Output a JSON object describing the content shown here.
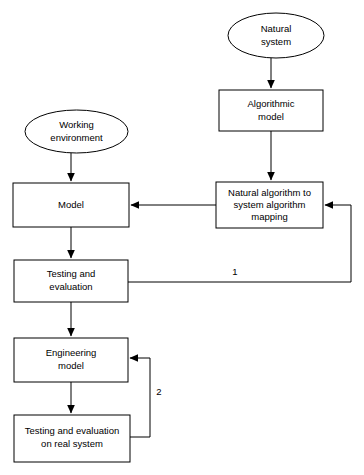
{
  "diagram": {
    "background_color": "#ffffff",
    "stroke_color": "#000000",
    "nodes": [
      {
        "id": "natural-system",
        "shape": "ellipse",
        "lines": [
          "Natural",
          "system"
        ],
        "cx": 276,
        "cy": 35.5,
        "rx": 48,
        "ry": 22.5
      },
      {
        "id": "algorithmic-model",
        "shape": "rect",
        "lines": [
          "Algorithmic",
          "model"
        ],
        "x": 219,
        "y": 90,
        "w": 104,
        "h": 41
      },
      {
        "id": "working-environment",
        "shape": "ellipse",
        "lines": [
          "Working",
          "environment"
        ],
        "cx": 76.5,
        "cy": 131.5,
        "rx": 51.5,
        "ry": 21.5
      },
      {
        "id": "natural-algorithm-mapping",
        "shape": "rect",
        "lines": [
          "Natural algorithm to",
          "system algorithm",
          "mapping"
        ],
        "x": 216,
        "y": 182,
        "w": 107,
        "h": 46
      },
      {
        "id": "model",
        "shape": "rect",
        "lines": [
          "Model"
        ],
        "x": 13,
        "y": 183,
        "w": 116,
        "h": 44
      },
      {
        "id": "testing-and-evaluation",
        "shape": "rect",
        "lines": [
          "Testing and",
          "evaluation"
        ],
        "x": 14,
        "y": 260,
        "w": 114,
        "h": 42
      },
      {
        "id": "engineering-model",
        "shape": "rect",
        "lines": [
          "Engineering",
          "model"
        ],
        "x": 14,
        "y": 338,
        "w": 114,
        "h": 44
      },
      {
        "id": "testing-real-system",
        "shape": "rect",
        "lines": [
          "Testing and evaluation",
          "on real system"
        ],
        "x": 14,
        "y": 415,
        "w": 116,
        "h": 47
      }
    ],
    "edges": [
      {
        "id": "edge-natural-system-to-algorithmic-model",
        "from": "natural-system",
        "to": "algorithmic-model",
        "label": "",
        "arrow": true
      },
      {
        "id": "edge-algorithmic-model-to-mapping",
        "from": "algorithmic-model",
        "to": "natural-algorithm-mapping",
        "label": "",
        "arrow": true
      },
      {
        "id": "edge-working-environment-to-model",
        "from": "working-environment",
        "to": "model",
        "label": "",
        "arrow": true
      },
      {
        "id": "edge-mapping-to-model",
        "from": "natural-algorithm-mapping",
        "to": "model",
        "label": "",
        "arrow": true
      },
      {
        "id": "edge-model-to-testing",
        "from": "model",
        "to": "testing-and-evaluation",
        "label": "",
        "arrow": true
      },
      {
        "id": "edge-testing-to-mapping-feedback",
        "from": "testing-and-evaluation",
        "to": "natural-algorithm-mapping",
        "label": "1",
        "label_x": 235,
        "label_y": 272,
        "arrow": true
      },
      {
        "id": "edge-testing-to-engineering-model",
        "from": "testing-and-evaluation",
        "to": "engineering-model",
        "label": "",
        "arrow": true
      },
      {
        "id": "edge-engineering-model-to-testing-real",
        "from": "engineering-model",
        "to": "testing-real-system",
        "label": "",
        "arrow": true
      },
      {
        "id": "edge-testing-real-to-engineering-feedback",
        "from": "testing-real-system",
        "to": "engineering-model",
        "label": "2",
        "label_x": 159,
        "label_y": 392,
        "arrow": true
      }
    ]
  }
}
